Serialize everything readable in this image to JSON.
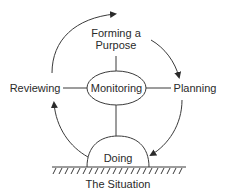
{
  "diagram": {
    "nodes": {
      "forming_line1": "Forming a",
      "forming_line2": "Purpose",
      "reviewing": "Reviewing",
      "monitoring": "Monitoring",
      "planning": "Planning",
      "doing": "Doing",
      "situation": "The Situation"
    },
    "edges": [
      {
        "from": "Reviewing",
        "to": "Forming a Purpose",
        "type": "curved-arrow"
      },
      {
        "from": "Forming a Purpose",
        "to": "Planning",
        "type": "curved-arrow"
      },
      {
        "from": "Planning",
        "to": "Doing",
        "type": "curved-arrow"
      },
      {
        "from": "Doing",
        "to": "Reviewing",
        "type": "curved-arrow"
      },
      {
        "from": "Monitoring",
        "to": "Forming a Purpose",
        "type": "line"
      },
      {
        "from": "Monitoring",
        "to": "Reviewing",
        "type": "line"
      },
      {
        "from": "Monitoring",
        "to": "Planning",
        "type": "line"
      },
      {
        "from": "Monitoring",
        "to": "Doing",
        "type": "line"
      }
    ],
    "colors": {
      "stroke": "#3a3a3a",
      "text": "#2a2a2a",
      "background": "#ffffff"
    }
  }
}
